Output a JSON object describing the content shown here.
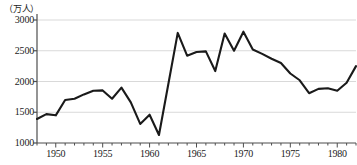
{
  "chart_data": {
    "type": "line",
    "title": "",
    "subtitle": "",
    "xlabel": "",
    "ylabel": "",
    "unit_label": "（万人）",
    "grid": true,
    "legend": null,
    "xlim": [
      1948,
      1982
    ],
    "ylim": [
      1000,
      3000
    ],
    "y_ticks": [
      1000,
      1500,
      2000,
      2500,
      3000
    ],
    "y_tick_labels": [
      "1000",
      "1500",
      "2000",
      "2500",
      "3000"
    ],
    "x_ticks": [
      1950,
      1955,
      1960,
      1965,
      1970,
      1975,
      1980
    ],
    "x_tick_labels": [
      "1950",
      "1955",
      "1960",
      "1965",
      "1970",
      "1975",
      "1980"
    ],
    "x_minor_ticks": [
      1948,
      1949,
      1950,
      1951,
      1952,
      1953,
      1954,
      1955,
      1956,
      1957,
      1958,
      1959,
      1960,
      1961,
      1962,
      1963,
      1964,
      1965,
      1966,
      1967,
      1968,
      1969,
      1970,
      1971,
      1972,
      1973,
      1974,
      1975,
      1976,
      1977,
      1978,
      1979,
      1980,
      1981,
      1982
    ],
    "line_color": "#1a1a1a",
    "grid_color": "#d9d9d9",
    "axis_color": "#4d4d4d",
    "x": [
      1948,
      1949,
      1950,
      1951,
      1952,
      1953,
      1954,
      1955,
      1956,
      1957,
      1958,
      1959,
      1960,
      1961,
      1962,
      1963,
      1964,
      1965,
      1966,
      1967,
      1968,
      1969,
      1970,
      1971,
      1972,
      1973,
      1974,
      1975,
      1976,
      1977,
      1978,
      1979,
      1980,
      1981,
      1982
    ],
    "values": [
      1390,
      1470,
      1450,
      1700,
      1720,
      1790,
      1850,
      1855,
      1720,
      1900,
      1660,
      1310,
      1460,
      1130,
      1960,
      2790,
      2420,
      2480,
      2490,
      2170,
      2780,
      2500,
      2810,
      2520,
      2450,
      2370,
      2300,
      2130,
      2020,
      1810,
      1880,
      1890,
      1850,
      1980,
      2250
    ],
    "series": [
      {
        "name": "",
        "values": [
          1390,
          1470,
          1450,
          1700,
          1720,
          1790,
          1850,
          1855,
          1720,
          1900,
          1660,
          1310,
          1460,
          1130,
          1960,
          2790,
          2420,
          2480,
          2490,
          2170,
          2780,
          2500,
          2810,
          2520,
          2450,
          2370,
          2300,
          2130,
          2020,
          1810,
          1880,
          1890,
          1850,
          1980,
          2250
        ]
      }
    ]
  }
}
